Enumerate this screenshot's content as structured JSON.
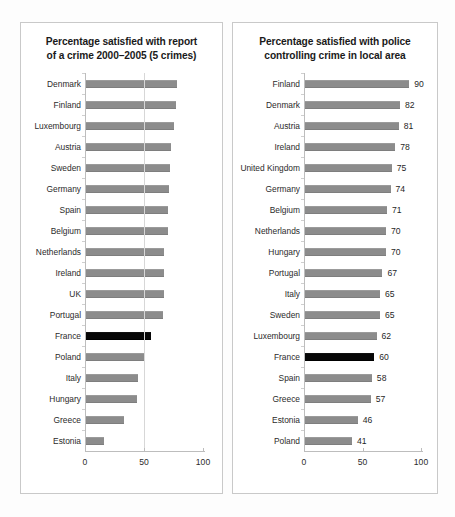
{
  "figure": {
    "background_color": "#ffffff",
    "panel_border_color": "#c9c9c9",
    "bar_color": "#8c8c8c",
    "highlight_color": "#070707",
    "highlight_country": "France"
  },
  "chart_data": [
    {
      "type": "bar",
      "orientation": "horizontal",
      "panel": "left",
      "title": "Percentage satisfied with report of a crime 2000–2005 (5 crimes)",
      "title_line_1": "Percentage satisfied with report",
      "title_line_2": "of a crime 2000–2005 (5 crimes)",
      "xlabel": "",
      "ylabel": "",
      "xlim": [
        0,
        100
      ],
      "xticks": [
        0,
        50,
        100
      ],
      "xtick_labels": [
        "0",
        "50",
        "100"
      ],
      "grid": true,
      "gridlines_at": [
        50
      ],
      "legend": "none",
      "data_labels_shown": false,
      "categories": [
        "Denmark",
        "Finland",
        "Luxembourg",
        "Austria",
        "Sweden",
        "Germany",
        "Spain",
        "Belgium",
        "Netherlands",
        "Ireland",
        "UK",
        "Portugal",
        "France",
        "Poland",
        "Italy",
        "Hungary",
        "Greece",
        "Estonia"
      ],
      "values": [
        78,
        77,
        75,
        73,
        72,
        71,
        70,
        70,
        67,
        67,
        67,
        66,
        56,
        50,
        45,
        44,
        33,
        16
      ],
      "highlighted": [
        "France"
      ]
    },
    {
      "type": "bar",
      "orientation": "horizontal",
      "panel": "right",
      "title": "Percentage satisfied with police controlling crime in local area",
      "title_line_1": "Percentage satisfied with police",
      "title_line_2": "controlling crime in local area",
      "xlabel": "",
      "ylabel": "",
      "xlim": [
        0,
        100
      ],
      "xticks": [
        0,
        50,
        100
      ],
      "xtick_labels": [
        "0",
        "50",
        "100"
      ],
      "grid": false,
      "gridlines_at": [],
      "legend": "none",
      "data_labels_shown": true,
      "categories": [
        "Finland",
        "Denmark",
        "Austria",
        "Ireland",
        "United Kingdom",
        "Germany",
        "Belgium",
        "Netherlands",
        "Hungary",
        "Portugal",
        "Italy",
        "Sweden",
        "Luxembourg",
        "France",
        "Spain",
        "Greece",
        "Estonia",
        "Poland"
      ],
      "values": [
        90,
        82,
        81,
        78,
        75,
        74,
        71,
        70,
        70,
        67,
        65,
        65,
        62,
        60,
        58,
        57,
        46,
        41
      ],
      "value_labels": [
        "90",
        "82",
        "81",
        "78",
        "75",
        "74",
        "71",
        "70",
        "70",
        "67",
        "65",
        "65",
        "62",
        "60",
        "58",
        "57",
        "46",
        "41"
      ],
      "highlighted": [
        "France"
      ]
    }
  ]
}
